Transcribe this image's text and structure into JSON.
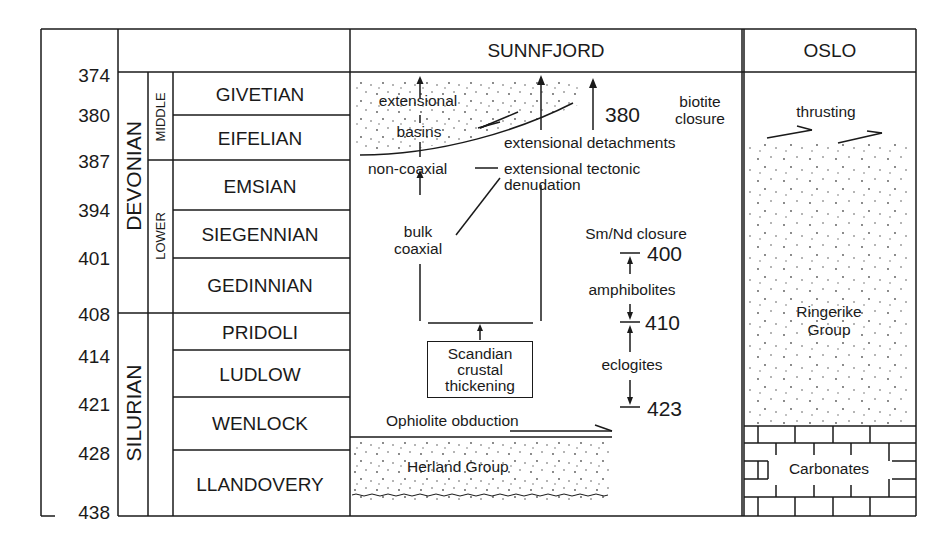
{
  "columns": {
    "sunnfjord": "SUNNFJORD",
    "oslo": "OSLO"
  },
  "ages": [
    "374",
    "380",
    "387",
    "394",
    "401",
    "408",
    "414",
    "421",
    "428",
    "438"
  ],
  "periods": [
    {
      "name": "DEVONIAN"
    },
    {
      "name": "SILURIAN"
    }
  ],
  "epochs": [
    {
      "name": "MIDDLE"
    },
    {
      "name": "LOWER"
    }
  ],
  "stages": [
    "GIVETIAN",
    "EIFELIAN",
    "EMSIAN",
    "SIEGENNIAN",
    "GEDINNIAN",
    "PRIDOLI",
    "LUDLOW",
    "WENLOCK",
    "LLANDOVERY"
  ],
  "sunnfjord": {
    "extensional_basins_1": "extensional",
    "extensional_basins_2": "basins",
    "age_380": "380",
    "biotite_1": "biotite",
    "biotite_2": "closure",
    "extensional_detachments": "extensional detachments",
    "non_coaxial": "non-coaxial",
    "ext_tectonic_1": "extensional tectonic",
    "ext_tectonic_2": "denudation",
    "bulk_1": "bulk",
    "bulk_2": "coaxial",
    "smnd": "Sm/Nd closure",
    "age_400": "400",
    "amphibolites": "amphibolites",
    "age_410": "410",
    "eclogites": "eclogites",
    "age_423": "423",
    "scandian_1": "Scandian",
    "scandian_2": "crustal",
    "scandian_3": "thickening",
    "ophiolite": "Ophiolite obduction",
    "herland": "Herland Group"
  },
  "oslo": {
    "thrusting": "thrusting",
    "ringerike_1": "Ringerike",
    "ringerike_2": "Group",
    "carbonates": "Carbonates"
  },
  "colors": {
    "ink": "#1a1a1a",
    "paper": "#ffffff",
    "stipple": "#555555"
  }
}
